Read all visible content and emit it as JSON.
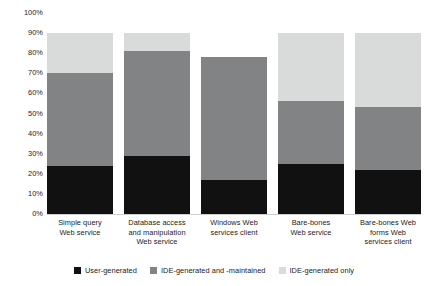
{
  "chart_data": {
    "type": "bar",
    "subtype": "stacked-bar",
    "title": "",
    "xlabel": "",
    "ylabel": "",
    "ylim": [
      0,
      100
    ],
    "yticks": [
      "0%",
      "10%",
      "20%",
      "30%",
      "40%",
      "50%",
      "60%",
      "70%",
      "80%",
      "90%",
      "100%"
    ],
    "ytick_values": [
      0,
      10,
      20,
      30,
      40,
      50,
      60,
      70,
      80,
      90,
      100
    ],
    "grid": false,
    "legend_position": "bottom",
    "categories": [
      "Simple query\nWeb service",
      "Database access\nand manipulation\nWeb service",
      "Windows Web\nservices client",
      "Bare-bones\nWeb service",
      "Bare-bones Web\nforms Web\nservices client"
    ],
    "series": [
      {
        "name": "User-generated",
        "color": "#111111",
        "values": [
          24,
          29,
          17,
          25,
          22
        ]
      },
      {
        "name": "IDE-generated and -maintained",
        "color": "#828384",
        "values": [
          46,
          52,
          61,
          31,
          31
        ]
      },
      {
        "name": "IDE-generated only",
        "color": "#d9dada",
        "values": [
          20,
          9,
          0,
          34,
          37
        ]
      }
    ],
    "stack_totals": [
      90,
      90,
      78,
      90,
      90
    ]
  },
  "axis": {
    "y_ticks": [
      {
        "label": "100%",
        "value": 100
      },
      {
        "label": "90%",
        "value": 90
      },
      {
        "label": "80%",
        "value": 80
      },
      {
        "label": "70%",
        "value": 70
      },
      {
        "label": "60%",
        "value": 60
      },
      {
        "label": "50%",
        "value": 50
      },
      {
        "label": "40%",
        "value": 40
      },
      {
        "label": "30%",
        "value": 30
      },
      {
        "label": "20%",
        "value": 20
      },
      {
        "label": "10%",
        "value": 10
      },
      {
        "label": "0%",
        "value": 0
      }
    ]
  },
  "x_labels": [
    {
      "lines": [
        "Simple query",
        "Web service"
      ]
    },
    {
      "lines": [
        "Database access",
        "and manipulation",
        "Web service"
      ]
    },
    {
      "lines": [
        "Windows Web",
        "services client"
      ]
    },
    {
      "lines": [
        "Bare-bones",
        "Web service"
      ]
    },
    {
      "lines": [
        "Bare-bones Web",
        "forms Web",
        "services client"
      ]
    }
  ],
  "legend": {
    "items": [
      {
        "label": "User-generated",
        "color": "#111111"
      },
      {
        "label": "IDE-generated and -maintained",
        "color": "#828384"
      },
      {
        "label": "IDE-generated only",
        "color": "#d9dada"
      }
    ]
  }
}
